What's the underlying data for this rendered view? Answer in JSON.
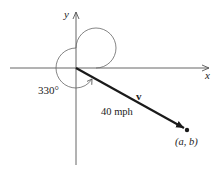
{
  "diagram": {
    "type": "vector-angle-diagram",
    "axes": {
      "x_label": "x",
      "y_label": "y"
    },
    "angle": {
      "label": "330°",
      "degrees": 330
    },
    "vector": {
      "name": "v",
      "magnitude_label": "40 mph",
      "endpoint_label": "(a, b)"
    },
    "colors": {
      "axis": "#555555",
      "vector": "#1a1a1a",
      "text": "#222222"
    }
  }
}
